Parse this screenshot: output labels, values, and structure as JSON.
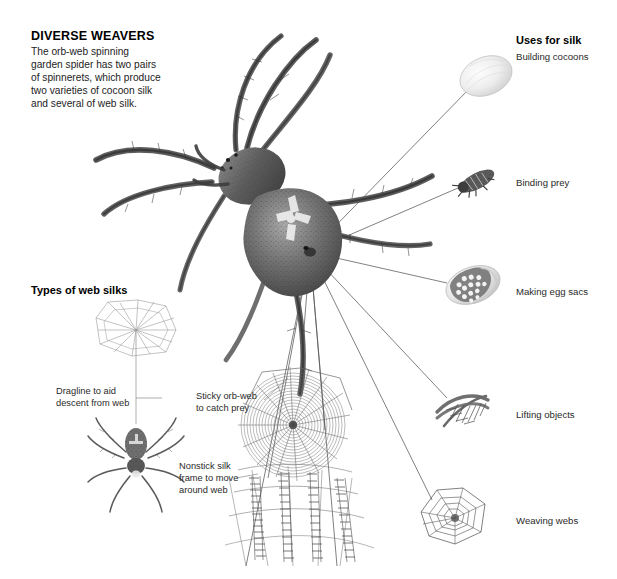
{
  "figure": {
    "title": "DIVERSE WEAVERS",
    "intro": "The orb-web spinning\ngarden spider has two pairs\nof spinnerets, which produce\ntwo varieties of cocoon silk\nand several of web silk.",
    "background_color": "#ffffff",
    "ink_color": "#2a2a2a",
    "leader_line_color": "#555555"
  },
  "uses_panel": {
    "heading": "Uses for silk",
    "items": [
      {
        "id": "cocoon",
        "label": "Building cocoons",
        "icon": "cocoon-oval-icon"
      },
      {
        "id": "prey",
        "label": "Binding prey",
        "icon": "wrapped-insect-icon"
      },
      {
        "id": "eggsac",
        "label": "Making egg sacs",
        "icon": "egg-sac-icon"
      },
      {
        "id": "lifting",
        "label": "Lifting objects",
        "icon": "silk-bundle-icon"
      },
      {
        "id": "weaving",
        "label": "Weaving webs",
        "icon": "orb-web-icon"
      }
    ]
  },
  "silk_types_panel": {
    "heading": "Types of web silks",
    "callouts": [
      {
        "id": "dragline",
        "label": "Dragline to aid\ndescent from web"
      },
      {
        "id": "sticky",
        "label": "Sticky orb-web\nto catch prey"
      },
      {
        "id": "nonstick",
        "label": "Nonstick silk\nframe to move\naround web"
      }
    ]
  },
  "illustrations": {
    "main_spider": {
      "name": "garden-spider-dorsal",
      "spinneret_point": [
        310,
        252
      ]
    },
    "hanging_spider": {
      "name": "hanging-spider-on-dragline",
      "center": [
        135,
        460
      ]
    },
    "hub_web": {
      "name": "radial-web-hub",
      "center": [
        136,
        330
      ]
    },
    "orb_web_detail": {
      "name": "sticky-spiral-orb-web",
      "center": [
        293,
        425
      ]
    }
  }
}
